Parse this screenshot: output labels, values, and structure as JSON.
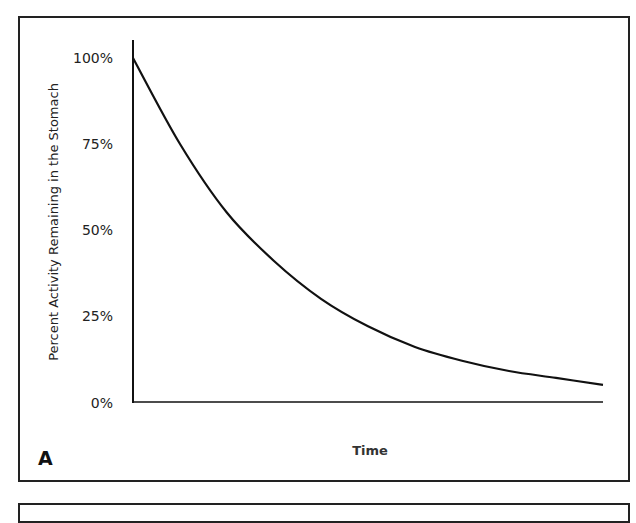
{
  "panel_label": "A",
  "chart_data": {
    "type": "line",
    "title": "",
    "xlabel": "Time",
    "ylabel": "Percent Activity Remaining in the Stomach",
    "yticks": [
      "0%",
      "25%",
      "50%",
      "75%",
      "100%"
    ],
    "ylim": [
      0,
      100
    ],
    "xticks": [],
    "grid": false,
    "legend": null,
    "series": [
      {
        "name": "Activity remaining",
        "x": [
          0,
          0.1,
          0.2,
          0.3,
          0.4,
          0.5,
          0.6,
          0.7,
          0.8,
          0.9,
          1.0
        ],
        "values": [
          100,
          75,
          55,
          41,
          30,
          22,
          16,
          12,
          9,
          7,
          5
        ]
      }
    ]
  }
}
